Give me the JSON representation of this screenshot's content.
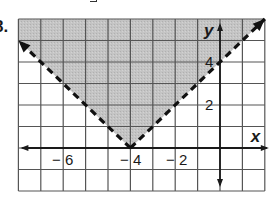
{
  "problem": {
    "number": "8."
  },
  "chart_data": {
    "type": "line",
    "title": "",
    "inequality": "y > |x + 4|",
    "boundary": {
      "style": "dashed",
      "vertex": [
        -4,
        0
      ],
      "left_arm": {
        "equation": "y = -(x + 4)",
        "points": [
          [
            -9,
            5
          ],
          [
            -4,
            0
          ]
        ]
      },
      "right_arm": {
        "equation": "y = x + 4",
        "points": [
          [
            -4,
            0
          ],
          [
            2,
            6
          ]
        ]
      }
    },
    "shaded_region": "above boundary",
    "xlabel": "x",
    "ylabel": "y",
    "xlim": [
      -9,
      2
    ],
    "ylim": [
      -2,
      6
    ],
    "grid": true,
    "x_ticks_labeled": [
      -6,
      -4,
      -2
    ],
    "y_ticks_labeled": [
      2,
      4
    ],
    "x_tick_labels": [
      "− 6",
      "− 4",
      "− 2"
    ],
    "y_tick_labels": [
      "2",
      "4"
    ]
  },
  "colors": {
    "shade": "#c4c4c4",
    "grid": "#555555",
    "axis": "#1a1a1a",
    "boundary": "#111111",
    "background": "#ffffff"
  }
}
